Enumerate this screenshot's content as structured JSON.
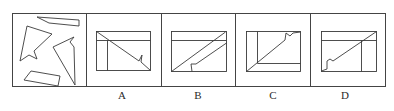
{
  "puzzle": {
    "question_panel": {
      "description": "Four scattered fragment shapes to be assembled",
      "shapes": [
        {
          "name": "top-sliver",
          "points": [
            [
              37,
              17
            ],
            [
              79,
              20
            ],
            [
              79,
              26
            ],
            [
              49,
              23
            ]
          ]
        },
        {
          "name": "left-arrow",
          "points": [
            [
              27,
              26
            ],
            [
              52,
              34
            ],
            [
              34,
              51
            ],
            [
              37,
              59
            ],
            [
              29,
              55
            ],
            [
              20,
              61
            ]
          ]
        },
        {
          "name": "right-arrow",
          "points": [
            [
              53,
              47
            ],
            [
              74,
              37
            ],
            [
              70,
              42
            ],
            [
              74,
              47
            ],
            [
              75,
              85
            ],
            [
              72,
              83
            ]
          ]
        },
        {
          "name": "bottom-quad",
          "points": [
            [
              31,
              71
            ],
            [
              60,
              76
            ],
            [
              58,
              86
            ],
            [
              24,
              80
            ]
          ]
        }
      ]
    },
    "options": [
      {
        "label": "A"
      },
      {
        "label": "B"
      },
      {
        "label": "C"
      },
      {
        "label": "D"
      }
    ]
  },
  "colors": {
    "stroke": "#3a3a3a",
    "background": "#ffffff"
  }
}
